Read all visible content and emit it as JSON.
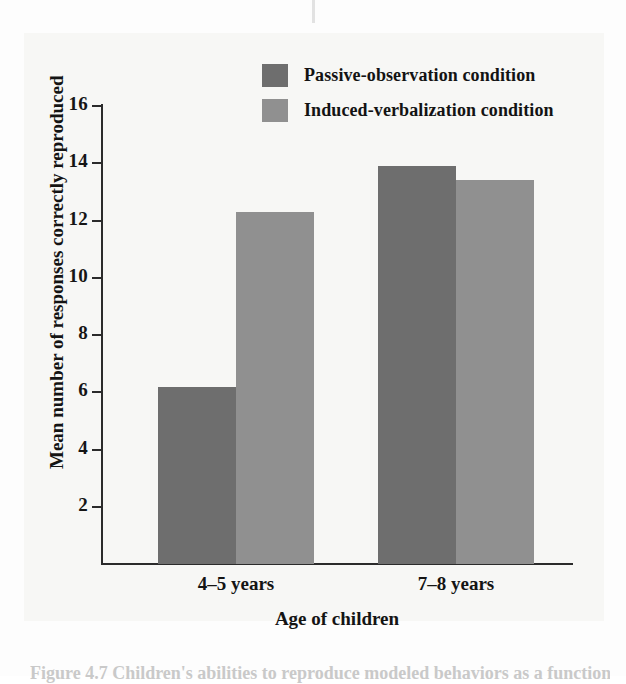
{
  "figure": {
    "caption_partial": "Figure 4.7  Children's abilities to reproduce modeled behaviors as a function",
    "background_color": "#fdfdfd",
    "panel_color": "#f7f7f5"
  },
  "legend": {
    "position": "top-center",
    "items": [
      {
        "label": "Passive-observation condition",
        "color": "#6e6e6e",
        "swatch_name": "legend-swatch-passive"
      },
      {
        "label": "Induced-verbalization condition",
        "color": "#909090",
        "swatch_name": "legend-swatch-induced"
      }
    ]
  },
  "chart_data": {
    "type": "bar",
    "title": "",
    "xlabel": "Age of children",
    "ylabel": "Mean number of responses correctly reproduced",
    "categories": [
      "4–5 years",
      "7–8 years"
    ],
    "series": [
      {
        "name": "Passive-observation condition",
        "color": "#6e6e6e",
        "values": [
          6.2,
          13.9
        ]
      },
      {
        "name": "Induced-verbalization condition",
        "color": "#909090",
        "values": [
          12.3,
          13.4
        ]
      }
    ],
    "ylim": [
      0,
      16
    ],
    "yticks": [
      2,
      4,
      6,
      8,
      10,
      12,
      14,
      16
    ],
    "ytick_labels": [
      "2",
      "4",
      "6",
      "8",
      "10",
      "12",
      "14",
      "16"
    ],
    "grid": false,
    "axis_color": "#2b2b2b"
  }
}
